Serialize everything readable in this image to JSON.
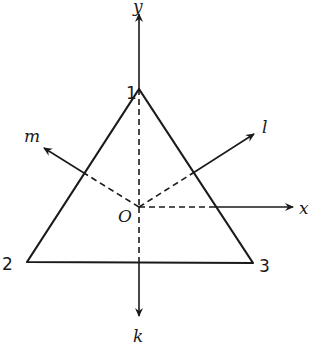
{
  "diagram": {
    "type": "equilateral triangle with symmetry axes",
    "colors": {
      "ink": "#1a1a1a",
      "background": "#ffffff"
    },
    "vertices": [
      {
        "label": "1",
        "x": 139,
        "y": 89
      },
      {
        "label": "2",
        "x": 27,
        "y": 262
      },
      {
        "label": "3",
        "x": 253,
        "y": 263
      }
    ],
    "origin": {
      "label": "O",
      "x": 139,
      "y": 207
    },
    "axes": [
      {
        "label": "y",
        "tip_x": 139,
        "tip_y": 12
      },
      {
        "label": "x",
        "tip_x": 295,
        "tip_y": 207
      },
      {
        "label": "l",
        "tip_x": 256,
        "tip_y": 133
      },
      {
        "label": "m",
        "tip_x": 42,
        "tip_y": 147
      },
      {
        "label": "k",
        "tip_x": 139,
        "tip_y": 318
      }
    ]
  }
}
